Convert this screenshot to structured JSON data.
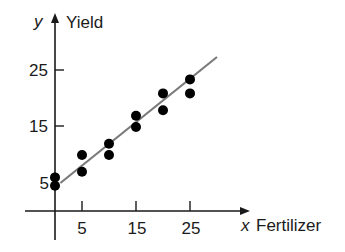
{
  "chart_data": {
    "type": "scatter",
    "title": "",
    "xlabel": "Fertilizer",
    "ylabel": "Yield",
    "x_var": "x",
    "y_var": "y",
    "x_ticks": [
      5,
      15,
      25
    ],
    "y_ticks": [
      5,
      15,
      25
    ],
    "xlim": [
      -5.5,
      36
    ],
    "ylim": [
      -5,
      35
    ],
    "grid": false,
    "legend": null,
    "points": [
      {
        "x": 0,
        "y": 6
      },
      {
        "x": 0,
        "y": 4.5
      },
      {
        "x": 5,
        "y": 10
      },
      {
        "x": 5,
        "y": 7
      },
      {
        "x": 10,
        "y": 12
      },
      {
        "x": 10,
        "y": 10
      },
      {
        "x": 15,
        "y": 17
      },
      {
        "x": 15,
        "y": 15
      },
      {
        "x": 20,
        "y": 21
      },
      {
        "x": 20,
        "y": 18
      },
      {
        "x": 25,
        "y": 23.5
      },
      {
        "x": 25,
        "y": 21
      }
    ],
    "trend_line": {
      "x1": 1,
      "y1": 5,
      "x2": 30,
      "y2": 27.5,
      "color": "#7a7a7a"
    },
    "point_color": "#000000",
    "axis_color": "#1a1a1a"
  },
  "labels": {
    "x_var": "x",
    "x_name": "Fertilizer",
    "y_var": "y",
    "y_name": "Yield",
    "x_tick_0": "5",
    "x_tick_1": "15",
    "x_tick_2": "25",
    "y_tick_0": "5",
    "y_tick_1": "15",
    "y_tick_2": "25"
  }
}
